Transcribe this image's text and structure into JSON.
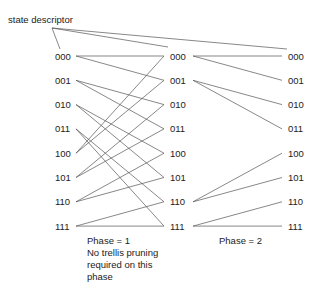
{
  "title": "state descriptor",
  "states": [
    "000",
    "001",
    "010",
    "011",
    "100",
    "101",
    "110",
    "111"
  ],
  "columns": 3,
  "stages": [
    {
      "caption": [
        "Phase = 1",
        "No trellis pruning",
        "required on this",
        "phase"
      ],
      "edges": [
        [
          "000",
          "000"
        ],
        [
          "000",
          "001"
        ],
        [
          "001",
          "010"
        ],
        [
          "001",
          "011"
        ],
        [
          "010",
          "100"
        ],
        [
          "010",
          "101"
        ],
        [
          "011",
          "110"
        ],
        [
          "011",
          "111"
        ],
        [
          "100",
          "000"
        ],
        [
          "100",
          "001"
        ],
        [
          "101",
          "010"
        ],
        [
          "101",
          "011"
        ],
        [
          "110",
          "100"
        ],
        [
          "110",
          "101"
        ],
        [
          "111",
          "110"
        ],
        [
          "111",
          "111"
        ]
      ]
    },
    {
      "caption": [
        "Phase = 2"
      ],
      "edges": [
        [
          "000",
          "000"
        ],
        [
          "000",
          "001"
        ],
        [
          "001",
          "010"
        ],
        [
          "001",
          "011"
        ],
        [
          "110",
          "100"
        ],
        [
          "110",
          "101"
        ],
        [
          "111",
          "110"
        ],
        [
          "111",
          "111"
        ]
      ]
    }
  ],
  "annotation_targets": "000 in each column"
}
